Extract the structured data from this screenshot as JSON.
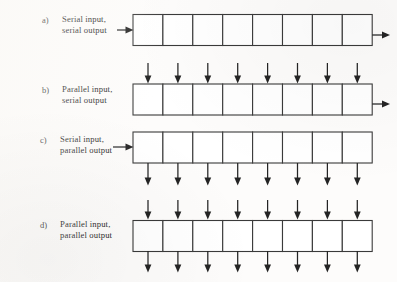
{
  "figure": {
    "background_color": "#fdfcfb",
    "line_color": "#242424",
    "cell_fill": "#ffffff",
    "cell_count": 8,
    "rows": [
      {
        "tag": "a)",
        "caption_line1": "Serial input,",
        "caption_line2": "serial output",
        "input_mode": "serial",
        "output_mode": "serial",
        "input_arrows": 1,
        "output_arrows": 1
      },
      {
        "tag": "b)",
        "caption_line1": "Parallel input,",
        "caption_line2": "serial output",
        "input_mode": "parallel",
        "output_mode": "serial",
        "input_arrows": 8,
        "output_arrows": 1
      },
      {
        "tag": "c)",
        "caption_line1": "Serial input,",
        "caption_line2": "parallel output",
        "input_mode": "serial",
        "output_mode": "parallel",
        "input_arrows": 1,
        "output_arrows": 8
      },
      {
        "tag": "d)",
        "caption_line1": "Parallel input,",
        "caption_line2": "parallel output",
        "input_mode": "parallel",
        "output_mode": "parallel",
        "input_arrows": 8,
        "output_arrows": 8
      }
    ]
  }
}
